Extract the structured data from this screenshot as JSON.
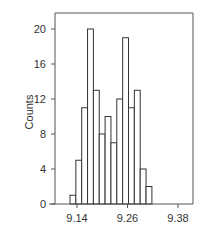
{
  "chart_data": {
    "type": "bar",
    "title": "",
    "xlabel": "",
    "ylabel": "Counts",
    "xlim": [
      9.1,
      9.4
    ],
    "ylim": [
      0,
      22
    ],
    "grid": false,
    "legend": null,
    "x_ticks": [
      9.14,
      9.26,
      9.38
    ],
    "x_tick_labels": [
      "9.14",
      "9.26",
      "9.38"
    ],
    "y_ticks": [
      0,
      4,
      8,
      12,
      16,
      20
    ],
    "y_tick_labels": [
      "0",
      "4",
      "8",
      "12",
      "16",
      "20"
    ],
    "bin_width": 0.0145,
    "bins_start": 9.125,
    "categories": [
      "9.125",
      "9.140",
      "9.154",
      "9.169",
      "9.183",
      "9.198",
      "9.212",
      "9.227",
      "9.241",
      "9.256",
      "9.270",
      "9.285",
      "9.299",
      "9.314"
    ],
    "values": [
      1,
      5,
      11,
      20,
      13,
      8,
      10,
      7,
      12,
      19,
      11,
      13,
      4,
      2
    ]
  },
  "colors": {
    "bar_fill": "#ffffff",
    "bar_stroke": "#333333",
    "axis": "#555555"
  }
}
